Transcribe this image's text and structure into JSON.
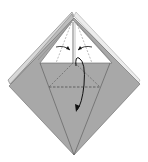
{
  "diagram": {
    "type": "origami-fold-step",
    "colors": {
      "paper_back": "#a6a6a6",
      "paper_front": "#ffffff",
      "line": "#555555",
      "arrow": "#111111",
      "background": "#ffffff"
    },
    "elements": {
      "outer_square": "diamond-shaped folded square base",
      "top_flap": "white upper triangle with layered edges",
      "center_crease": "vertical center line",
      "dashed_valley_horizontal": "horizontal dashed valley fold",
      "dashed_diagonals": "diagonal dashed fold lines",
      "left_arrow": "small curved arrow pointing to center (left)",
      "right_arrow": "small curved arrow pointing to center (right)",
      "fold_down_arrow": "large curved arrow indicating fold down"
    }
  }
}
